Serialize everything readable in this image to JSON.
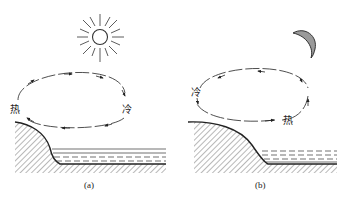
{
  "figure": {
    "panels": [
      {
        "id": "a",
        "caption": "(a)",
        "scene": "daytime",
        "celestial_icon": "sun-icon",
        "labels": {
          "left": "热",
          "right": "冷"
        },
        "circulation": "clockwise: rising over land (hot), flowing toward sea aloft, sinking over sea (cold), returning along surface toward land"
      },
      {
        "id": "b",
        "caption": "(b)",
        "scene": "nighttime",
        "celestial_icon": "moon-icon",
        "labels": {
          "left": "冷",
          "right": "热"
        },
        "circulation": "counterclockwise: rising over sea (hot), flowing toward land aloft, sinking over land (cold), returning along surface toward sea"
      }
    ],
    "colors": {
      "line": "#222222",
      "moon_fill": "#9a9a9a",
      "background": "#ffffff"
    }
  }
}
